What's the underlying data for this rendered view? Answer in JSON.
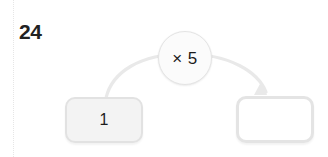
{
  "page": {
    "background_color": "#ffffff",
    "width": 328,
    "height": 157
  },
  "margin_guide": {
    "icon": "dotted-vertical-rule",
    "color": "#e6e6e6"
  },
  "problem": {
    "number_label": "24",
    "number_color": "#222222"
  },
  "machine": {
    "operator": {
      "label": "× 5",
      "operation": "multiply",
      "operand": 5,
      "shape": "circle",
      "fill_color": "#fbfbfb",
      "border_color": "#e4e4e4"
    },
    "arrow": {
      "icon": "curved-arrow-right-icon",
      "color": "#e8e8e8",
      "direction": "left-to-right"
    },
    "input_cell": {
      "value": "1",
      "placeholder": "",
      "fill_color": "#f3f3f3",
      "border_color": "#e2e2e2",
      "state": "filled"
    },
    "output_cell": {
      "value": "",
      "placeholder": "",
      "fill_color": "#ffffff",
      "border_color": "#e4e4e4",
      "state": "empty"
    }
  }
}
